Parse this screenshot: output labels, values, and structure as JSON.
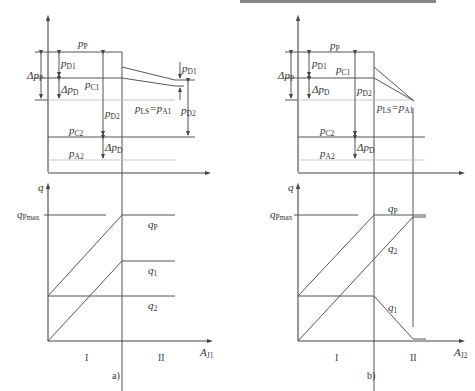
{
  "figure": {
    "panels": [
      {
        "id": "a",
        "caption": "a)",
        "top_labels": {
          "pP": {
            "main": "p",
            "sub": "P"
          },
          "dpP": {
            "main": "Δp",
            "sub": "P"
          },
          "pD1": {
            "main": "p",
            "sub": "D1"
          },
          "pC1": {
            "main": "p",
            "sub": "C1"
          },
          "dpD": {
            "main": "Δp",
            "sub": "D"
          },
          "pD2": {
            "main": "p",
            "sub": "D2"
          },
          "pLS": {
            "main": "p",
            "sub": "LS",
            "eq": "=p",
            "sub2": "A1"
          },
          "pC2": {
            "main": "p",
            "sub": "C2"
          },
          "pA2": {
            "main": "p",
            "sub": "A2"
          },
          "dpD_low": {
            "main": "Δp",
            "sub": "D"
          },
          "pD1_right": {
            "main": "p",
            "sub": "D1"
          },
          "pD2_right": {
            "main": "p",
            "sub": "D2"
          }
        },
        "bottom_labels": {
          "q_axis": "q",
          "qPmax": {
            "main": "q",
            "sub": "Pmax"
          },
          "qP": {
            "main": "q",
            "sub": "P"
          },
          "q1": {
            "main": "q",
            "sub": "1"
          },
          "q2": {
            "main": "q",
            "sub": "2"
          },
          "x_axis": {
            "main": "A",
            "sub": "J1"
          },
          "region1": "I",
          "region2": "II"
        }
      },
      {
        "id": "b",
        "caption": "b)",
        "top_labels": {
          "pP": {
            "main": "p",
            "sub": "P"
          },
          "dpP": {
            "main": "Δp",
            "sub": "P"
          },
          "pD1": {
            "main": "p",
            "sub": "D1"
          },
          "pC1": {
            "main": "p",
            "sub": "C1"
          },
          "dpD": {
            "main": "Δp",
            "sub": "D"
          },
          "pD2": {
            "main": "p",
            "sub": "D2"
          },
          "pLS": {
            "main": "p",
            "sub": "LS",
            "eq": "=p",
            "sub2": "A1"
          },
          "pC2": {
            "main": "p",
            "sub": "C2"
          },
          "pA2": {
            "main": "p",
            "sub": "A2"
          },
          "dpD_low": {
            "main": "Δp",
            "sub": "D"
          }
        },
        "bottom_labels": {
          "q_axis": "q",
          "qPmax": {
            "main": "q",
            "sub": "Pmax"
          },
          "qP": {
            "main": "q",
            "sub": "P"
          },
          "q1": {
            "main": "q",
            "sub": "1"
          },
          "q2": {
            "main": "q",
            "sub": "2"
          },
          "x_axis": {
            "main": "A",
            "sub": "J2"
          },
          "region1": "I",
          "region2": "II"
        }
      }
    ]
  }
}
